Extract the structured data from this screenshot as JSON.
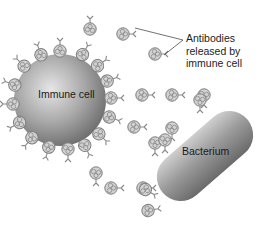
{
  "diagram": {
    "labels": {
      "immune_cell": "Immune cell",
      "bacterium": "Bacterium",
      "callout_lines": [
        "Antibodies",
        "released by",
        "immune cell"
      ]
    },
    "colors": {
      "background": "#ffffff",
      "cell_light": "#d8d8d8",
      "cell_dark": "#7a7a7a",
      "antibody": "#8a8a8a",
      "text": "#222222"
    },
    "entities": [
      {
        "id": "immune-cell",
        "shape": "sphere",
        "cx": 60,
        "cy": 100,
        "r": 46
      },
      {
        "id": "bacterium",
        "shape": "capsule",
        "x1": 168,
        "y1": 188,
        "x2": 243,
        "y2": 122,
        "thickness": 50
      },
      {
        "id": "callout-line",
        "from": [
          183,
          40
        ],
        "to": [
          135,
          28
        ]
      },
      {
        "id": "callout-line-2",
        "from": [
          183,
          40
        ],
        "to": [
          162,
          56
        ]
      }
    ]
  }
}
